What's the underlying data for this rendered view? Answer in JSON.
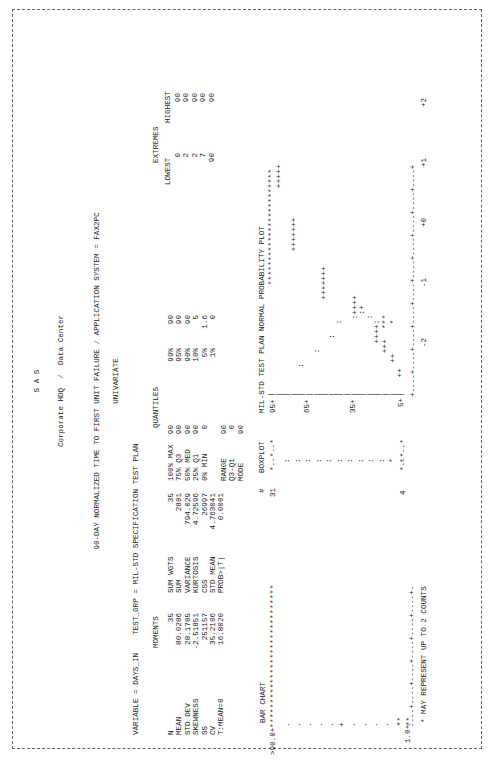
{
  "header": {
    "system": "S A S",
    "org": "Corporate HDQ  /  Data Center",
    "title": "90-DAY NORMALIZED TIME TO FIRST UNIT FAILURE / APPLICATION SYSTEM = FAX2PC",
    "procedure": "UNIVARIATE",
    "variable_line": "VARIABLE = DAYS_IN    TEST_GRP = MIL-STD SPECIFICATION TEST PLAN"
  },
  "moments": {
    "title": "MOMENTS",
    "rows": [
      [
        "N",
        "35",
        "SUM WGTS",
        "35"
      ],
      [
        "MEAN",
        "80.0286",
        "SUM",
        "2801"
      ],
      [
        "STD DEV",
        "28.1785",
        "VARIANCE",
        "794.029"
      ],
      [
        "SKEWNESS",
        "-2.51851",
        "KURTOSIS",
        "4.72596"
      ],
      [
        "SS",
        "251157",
        "CSS",
        "26997"
      ],
      [
        "CV",
        "35.2106",
        "STD MEAN",
        "4.763041"
      ],
      [
        "T:MEAN=0",
        "16.8020",
        "PROB>|T|",
        "0.0001"
      ]
    ]
  },
  "quantiles": {
    "title": "QUANTILES",
    "rows": [
      [
        "100% MAX",
        "90",
        "99%",
        "90"
      ],
      [
        "75% Q3",
        "90",
        "95%",
        "90"
      ],
      [
        "50% MED",
        "90",
        "90%",
        "90"
      ],
      [
        "25% Q1",
        "90",
        "10%",
        "5"
      ],
      [
        "0% MIN",
        "0",
        "5%",
        "1.6"
      ],
      [
        "",
        "",
        "1%",
        "0"
      ]
    ],
    "extra": [
      [
        "RANGE",
        "90"
      ],
      [
        "Q3-Q1",
        "0"
      ],
      [
        "MODE",
        "90"
      ]
    ]
  },
  "extremes": {
    "title": "EXTREMES",
    "headers": [
      "LOWEST",
      "HIGHEST"
    ],
    "lowest": [
      "0",
      "2",
      "2",
      "7",
      "90"
    ],
    "highest": [
      "90",
      "90",
      "90",
      "90",
      "90"
    ]
  },
  "bar_chart": {
    "title": "BAR CHART",
    "top_label": ">90.0+",
    "top_bar": "*****************************",
    "bottom_label": "1.0+",
    "bottom_bar": "**",
    "footnote": "* MAY REPRESENT UP TO 2 COUNTS"
  },
  "boxplot": {
    "count_header": "#",
    "title": "BOXPLOT",
    "count_top": "31",
    "count_bottom": "4"
  },
  "normal_plot": {
    "title": "MIL-STD TEST PLAN NORMAL PROBABILITY PLOT",
    "y_ticks": [
      "95+",
      "65+",
      "35+",
      "5+"
    ],
    "x_ticks": [
      "-2",
      "-1",
      "+0",
      "+1",
      "+2"
    ]
  },
  "chart_data": {
    "type": "table",
    "bar_chart": {
      "categories": [
        ">90.0",
        "1.0"
      ],
      "values": [
        31,
        4
      ]
    },
    "normal_probability_plot": {
      "y_range": [
        5,
        95
      ],
      "x_range": [
        -2,
        2
      ]
    }
  }
}
